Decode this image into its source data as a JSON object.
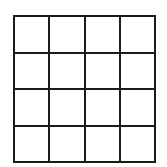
{
  "canvas": {
    "background_color": "#ffffff"
  },
  "grid": {
    "rows": 4,
    "cols": 4,
    "line_color": "#1b1b1b",
    "line_thickness_px": 2,
    "cell_color": "#ffffff"
  }
}
